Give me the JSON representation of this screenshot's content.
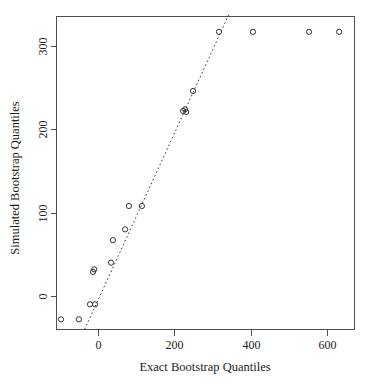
{
  "chart_data": {
    "type": "scatter",
    "title": "",
    "xlabel": "Exact Bootstrap Quantiles",
    "ylabel": "Simulated Bootstrap Quantiles",
    "xlim": [
      -135,
      675
    ],
    "ylim": [
      -45,
      345
    ],
    "xticks": [
      0,
      200,
      400,
      600
    ],
    "yticks": [
      0,
      100,
      200,
      300
    ],
    "xtick_labels": [
      "0",
      "200",
      "400",
      "600"
    ],
    "ytick_labels": [
      "0",
      "100",
      "200",
      "300"
    ],
    "grid": false,
    "legend": "none",
    "marker": "open-circle",
    "point_color": "#333333",
    "reference_line": {
      "style": "dotted",
      "color": "#3a3a3a",
      "x_start": -35,
      "y_start": -40,
      "x_end": 345,
      "y_end": 340
    },
    "points": [
      {
        "x": -97,
        "y": -28
      },
      {
        "x": -50,
        "y": -28
      },
      {
        "x": -21,
        "y": -10
      },
      {
        "x": -8,
        "y": -10
      },
      {
        "x": -13,
        "y": 29
      },
      {
        "x": -10,
        "y": 32
      },
      {
        "x": 34,
        "y": 40
      },
      {
        "x": 39,
        "y": 67
      },
      {
        "x": 71,
        "y": 80
      },
      {
        "x": 81,
        "y": 108
      },
      {
        "x": 115,
        "y": 108
      },
      {
        "x": 223,
        "y": 222
      },
      {
        "x": 228,
        "y": 224
      },
      {
        "x": 231,
        "y": 221
      },
      {
        "x": 249,
        "y": 246
      },
      {
        "x": 317,
        "y": 317
      },
      {
        "x": 406,
        "y": 317
      },
      {
        "x": 553,
        "y": 317
      },
      {
        "x": 632,
        "y": 317
      }
    ]
  }
}
